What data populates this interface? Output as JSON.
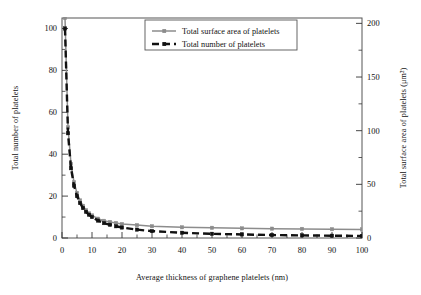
{
  "chart_data": {
    "type": "line",
    "title": "",
    "xlabel": "Average thickness of graphene platelets (nm)",
    "ylabel": "Total number of platelets",
    "y2label": "Total surface area of platelets (μm²)",
    "xlim": [
      0,
      100
    ],
    "ylim": [
      0,
      105
    ],
    "y2lim": [
      0,
      205
    ],
    "xticks": [
      0,
      10,
      20,
      30,
      40,
      50,
      60,
      70,
      80,
      90,
      100
    ],
    "xticklabels": [
      "0",
      "10",
      "20",
      "30",
      "40",
      "50",
      "60",
      "70",
      "80",
      "90",
      "100"
    ],
    "yticks": [
      0,
      20,
      40,
      60,
      80,
      100
    ],
    "yticklabels": [
      "0",
      "20",
      "40",
      "60",
      "80",
      "100"
    ],
    "y2ticks": [
      0,
      50,
      100,
      150,
      200
    ],
    "y2ticklabels": [
      "0",
      "50",
      "100",
      "150",
      "200"
    ],
    "xminorticks": [
      5,
      15,
      25,
      35,
      45,
      55,
      65,
      75,
      85,
      95
    ],
    "yminorticks": [
      10,
      30,
      50,
      70,
      90
    ],
    "y2minorticks": [
      25,
      75,
      125,
      175
    ],
    "grid": false,
    "legend_position": "top-center",
    "x": [
      1,
      2,
      3,
      4,
      5,
      6,
      7,
      8,
      9,
      10,
      12,
      14,
      16,
      18,
      20,
      25,
      30,
      40,
      50,
      60,
      70,
      80,
      90,
      100
    ],
    "series": [
      {
        "name": "Total surface area of platelets",
        "axis": "right",
        "color": "#8c8c8c",
        "linestyle": "solid",
        "marker": "square",
        "unit": "μm²",
        "values": [
          205,
          103,
          69,
          52,
          42,
          35,
          30,
          26,
          23,
          21,
          18,
          16,
          15,
          14,
          13,
          12,
          11,
          10,
          9.5,
          9,
          8.7,
          8.5,
          8.2,
          8
        ]
      },
      {
        "name": "Total number of platelets",
        "axis": "left",
        "color": "#111111",
        "linestyle": "dashed",
        "marker": "square",
        "unit": "",
        "values": [
          100,
          50,
          33.3,
          25,
          20,
          16.7,
          14.3,
          12.5,
          11.1,
          10,
          8.3,
          7.1,
          6.3,
          5.6,
          5,
          4,
          3.3,
          2.5,
          2,
          1.7,
          1.4,
          1.25,
          1.1,
          1
        ]
      }
    ],
    "legend": [
      {
        "label": "Total surface area of platelets",
        "color": "#8c8c8c",
        "style": "solid"
      },
      {
        "label": "Total number of platelets",
        "color": "#111111",
        "style": "dashed"
      }
    ]
  }
}
